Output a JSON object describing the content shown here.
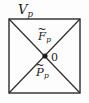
{
  "figure": {
    "name": "square-domain-with-diagonals",
    "background_color": "#fdfdfd",
    "line_color": "#2b2b2b",
    "text_color": "#1c1c1c",
    "square": {
      "x": 9,
      "y": 19,
      "width": 71,
      "height": 74,
      "stroke_width": 1.4
    },
    "diagonals": [
      {
        "name": "diagonal-top-left-to-bottom-right",
        "x1": 9,
        "y1": 19,
        "x2": 80,
        "y2": 93
      },
      {
        "name": "diagonal-top-right-to-bottom-left",
        "x1": 80,
        "y1": 19,
        "x2": 9,
        "y2": 93
      }
    ],
    "center_node": {
      "cx": 45,
      "cy": 56,
      "r": 2.6
    },
    "labels": {
      "volume": {
        "base": "V",
        "tilde": "",
        "subscript": "p"
      },
      "force": {
        "base": "F",
        "tilde": "~",
        "subscript": "p"
      },
      "pressure": {
        "base": "P",
        "tilde": "~",
        "subscript": "p"
      },
      "origin": "0"
    }
  }
}
